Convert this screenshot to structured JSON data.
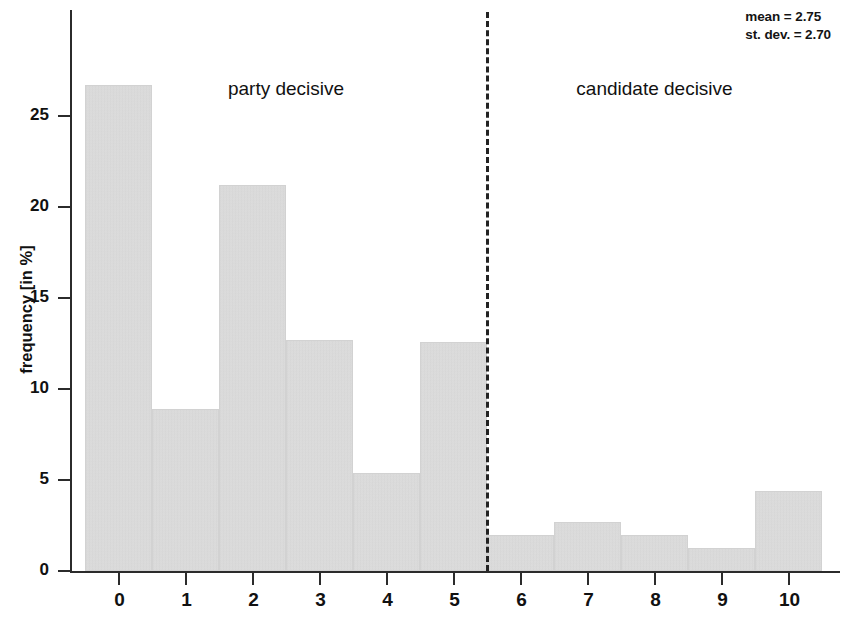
{
  "chart_data": {
    "type": "bar",
    "title": "",
    "subtitle": "",
    "xlabel": "",
    "ylabel": "frequency [in %]",
    "categories": [
      "0",
      "1",
      "2",
      "3",
      "4",
      "5",
      "6",
      "7",
      "8",
      "9",
      "10"
    ],
    "values": [
      26.7,
      8.9,
      21.2,
      12.7,
      5.4,
      12.6,
      2.0,
      2.7,
      2.0,
      1.25,
      4.4
    ],
    "xlim": [
      -0.5,
      10.5
    ],
    "ylim": [
      0,
      28
    ],
    "xticks": [
      "0",
      "1",
      "2",
      "3",
      "4",
      "5",
      "6",
      "7",
      "8",
      "9",
      "10"
    ],
    "yticks": [
      "0",
      "5",
      "10",
      "15",
      "20",
      "25"
    ],
    "ytick_values": [
      0,
      5,
      10,
      15,
      20,
      25
    ],
    "grid": false,
    "legend": false,
    "bar_color": "#e3e3e3",
    "axis_color": "#2b2b2b",
    "annotations": [
      {
        "name": "mean",
        "text": "mean = 2.75"
      },
      {
        "name": "st-dev",
        "text": "st. dev. = 2.70"
      },
      {
        "name": "party-decisive",
        "text": "party decisive",
        "x": 2.5
      },
      {
        "name": "candidate-decisive",
        "text": "candidate decisive",
        "x": 8.0
      }
    ],
    "divider": {
      "x": 5.5,
      "style": "dashed",
      "color": "#232323"
    }
  },
  "stats": {
    "mean_label": "mean = 2.75",
    "stdev_label": "st. dev. = 2.70"
  },
  "regions": {
    "left_label": "party decisive",
    "right_label": "candidate decisive"
  },
  "axes": {
    "y_title": "frequency [in %]"
  }
}
